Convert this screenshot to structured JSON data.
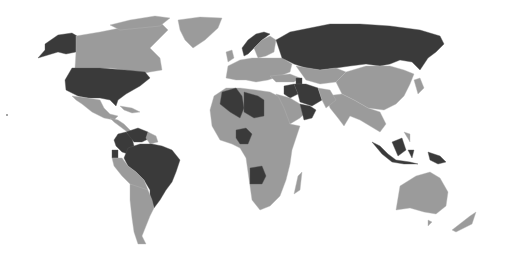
{
  "map": {
    "type": "choropleth world map",
    "projection": "Robinson-like",
    "colors": {
      "background": "#ffffff",
      "default_country": "#9b9b9b",
      "highlighted_country": "#3a3a3a"
    },
    "highlighted_countries": [
      "United States (incl. Alaska)",
      "Russia",
      "Norway",
      "Algeria",
      "Libya",
      "Nigeria",
      "Angola",
      "Iran",
      "Iraq",
      "Azerbaijan",
      "Kuwait",
      "Qatar",
      "United Arab Emirates",
      "Oman",
      "Venezuela",
      "Colombia",
      "Ecuador",
      "Brazil",
      "Indonesia",
      "Malaysia",
      "Papua New Guinea"
    ]
  }
}
